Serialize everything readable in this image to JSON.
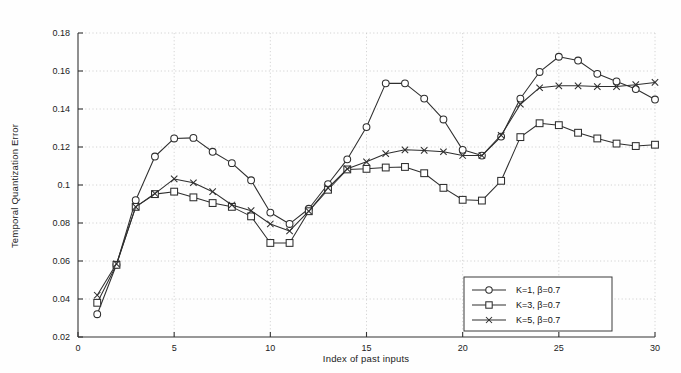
{
  "chart_data": {
    "type": "line",
    "title": "",
    "xlabel": "Index of past inputs",
    "ylabel": "Temporal Quantization Error",
    "xlim": [
      0,
      30
    ],
    "ylim": [
      0.02,
      0.18
    ],
    "xticks": [
      0,
      5,
      10,
      15,
      20,
      25,
      30
    ],
    "yticks": [
      0.02,
      0.04,
      0.06,
      0.08,
      0.1,
      0.12,
      0.14,
      0.16,
      0.18
    ],
    "xticklabels": [
      "0",
      "5",
      "10",
      "15",
      "20",
      "25",
      "30"
    ],
    "yticklabels": [
      "0.02",
      "0.04",
      "0.06",
      "0.08",
      "0.1",
      "0.12",
      "0.14",
      "0.16",
      "0.18"
    ],
    "grid": true,
    "grid_style": "dotted",
    "legend_position": "lower right",
    "x": [
      1,
      2,
      3,
      4,
      5,
      6,
      7,
      8,
      9,
      10,
      11,
      12,
      13,
      14,
      15,
      16,
      17,
      18,
      19,
      20,
      21,
      22,
      23,
      24,
      25,
      26,
      27,
      28,
      29,
      30
    ],
    "series": [
      {
        "name": "K=1, β=0.7",
        "marker": "circle",
        "values": [
          0.032,
          0.058,
          0.092,
          0.115,
          0.1245,
          0.1248,
          0.1175,
          0.1115,
          0.1025,
          0.0855,
          0.0795,
          0.0875,
          0.1005,
          0.1135,
          0.1305,
          0.1535,
          0.1535,
          0.1455,
          0.1345,
          0.1185,
          0.1155,
          0.1255,
          0.1455,
          0.1595,
          0.1675,
          0.1655,
          0.1585,
          0.1545,
          0.1505,
          0.145
        ]
      },
      {
        "name": "K=3, β=0.7",
        "marker": "square",
        "values": [
          0.038,
          0.058,
          0.0885,
          0.0952,
          0.0965,
          0.0935,
          0.0905,
          0.0885,
          0.0835,
          0.0695,
          0.0695,
          0.0862,
          0.0975,
          0.1082,
          0.1085,
          0.1092,
          0.1095,
          0.1062,
          0.0985,
          0.0922,
          0.0918,
          0.1022,
          0.1252,
          0.1325,
          0.1315,
          0.1275,
          0.1245,
          0.1218,
          0.1205,
          0.1212
        ]
      },
      {
        "name": "K=5, β=0.7",
        "marker": "x",
        "values": [
          0.042,
          0.0585,
          0.0885,
          0.0955,
          0.1032,
          0.1012,
          0.0965,
          0.0895,
          0.0865,
          0.0795,
          0.0758,
          0.0862,
          0.0985,
          0.1085,
          0.1122,
          0.1165,
          0.1185,
          0.1182,
          0.1175,
          0.1155,
          0.1155,
          0.1262,
          0.1425,
          0.1512,
          0.1522,
          0.1522,
          0.1518,
          0.1518,
          0.1528,
          0.154
        ]
      }
    ]
  },
  "legend": {
    "entries": [
      {
        "label": "K=1, β=0.7",
        "marker": "circle"
      },
      {
        "label": "K=3, β=0.7",
        "marker": "square"
      },
      {
        "label": "K=5, β=0.7",
        "marker": "x"
      }
    ]
  },
  "colors": {
    "line": "#2e2e2e",
    "grid": "#c9c9c9",
    "axis": "#333333",
    "background": "#fefefe"
  }
}
